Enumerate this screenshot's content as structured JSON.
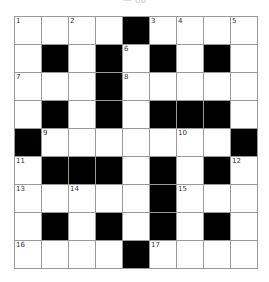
{
  "header": {
    "label": "— 00"
  },
  "colors": {
    "block": "#000000",
    "open": "#ffffff",
    "gridline": "#9a9a9a"
  },
  "puzzle": {
    "rows": 9,
    "cols": 9,
    "grid": [
      [
        "1",
        "",
        "2",
        "",
        "#",
        "3",
        "4",
        "",
        "5"
      ],
      [
        "",
        "#",
        "",
        "#",
        "6",
        "#",
        "",
        "#",
        ""
      ],
      [
        "7",
        "",
        "",
        "#",
        "8",
        "",
        "",
        "",
        ""
      ],
      [
        "",
        "#",
        "",
        "#",
        "",
        "#",
        "#",
        "#",
        ""
      ],
      [
        "#",
        "9",
        "",
        "",
        "",
        "",
        "10",
        "",
        "#"
      ],
      [
        "11",
        "#",
        "#",
        "#",
        "",
        "#",
        "",
        "#",
        "12"
      ],
      [
        "13",
        "",
        "14",
        "",
        "",
        "#",
        "15",
        "",
        ""
      ],
      [
        "",
        "#",
        "",
        "#",
        "",
        "#",
        "",
        "#",
        ""
      ],
      [
        "16",
        "",
        "",
        "",
        "#",
        "17",
        "",
        "",
        ""
      ]
    ]
  }
}
